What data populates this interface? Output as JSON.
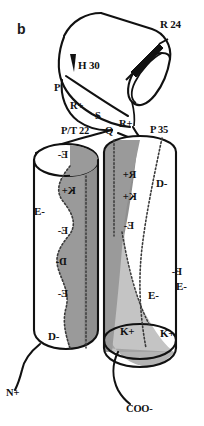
{
  "figure": {
    "panel_label": "b",
    "kind": "protein-helix-topology-diagram",
    "background_color": "#ffffff",
    "ink_color": "#111111",
    "shade_dark_color": "#9a9a9a",
    "shade_light_color": "#c4c4c4",
    "face_white_color": "#ffffff"
  },
  "top_helix": {
    "name": "top-helix-cylinder",
    "labels": {
      "r24": "R 24",
      "h30": "H 30",
      "p": "P",
      "r_plus_upper": "R+",
      "s": "S"
    }
  },
  "loop": {
    "name": "interhelical-loop",
    "labels": {
      "pt22": "P/T 22",
      "q": "Q",
      "r_plus_lower": "R+",
      "p35": "P 35"
    }
  },
  "left_helix": {
    "name": "left-helix-cylinder",
    "front_labels": [
      {
        "text": "E-",
        "side": "front"
      },
      {
        "text": "D-",
        "side": "front"
      }
    ],
    "back_labels": [
      {
        "text": "E-",
        "side": "back",
        "mirrored": true
      },
      {
        "text": "K+",
        "side": "back",
        "mirrored": true
      },
      {
        "text": "E-",
        "side": "back",
        "mirrored": true
      },
      {
        "text": "D-",
        "side": "back",
        "mirrored": true
      },
      {
        "text": "E-",
        "side": "back",
        "mirrored": true
      }
    ],
    "terminus": "N+"
  },
  "right_helix": {
    "name": "right-helix-cylinder",
    "front_labels": [
      {
        "text": "D-",
        "side": "front"
      },
      {
        "text": "E-",
        "side": "front"
      },
      {
        "text": "E-",
        "side": "front"
      },
      {
        "text": "K+",
        "side": "front"
      },
      {
        "text": "K+",
        "side": "front"
      }
    ],
    "back_labels": [
      {
        "text": "R+",
        "side": "back",
        "mirrored": true
      },
      {
        "text": "K+",
        "side": "back",
        "mirrored": true
      },
      {
        "text": "E-",
        "side": "back",
        "mirrored": true
      },
      {
        "text": "E-",
        "side": "back",
        "mirrored": true
      }
    ],
    "terminus": "COO-"
  }
}
